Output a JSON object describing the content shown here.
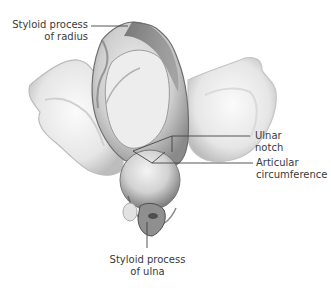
{
  "figure": {
    "background": "#ffffff",
    "label_color": "#3a3a3a",
    "leader_color": "#444444"
  },
  "labels": {
    "styloid_radius": {
      "line1": "Styloid process",
      "line2": "of radius"
    },
    "ulnar_notch": {
      "line1": "Ulnar",
      "line2": "notch"
    },
    "articular_circumference": {
      "line1": "Articular",
      "line2": "circumference"
    },
    "styloid_ulna": {
      "line1": "Styloid process",
      "line2": "of ulna"
    }
  }
}
